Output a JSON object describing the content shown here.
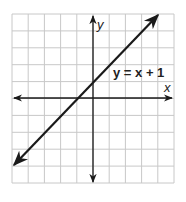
{
  "chart_data": {
    "type": "line",
    "title": "",
    "xlabel": "x",
    "ylabel": "y",
    "xlim": [
      -5,
      5
    ],
    "ylim": [
      -5,
      5
    ],
    "grid": true,
    "grid_step": 1,
    "series": [
      {
        "name": "y = x + 1",
        "equation": "y = x + 1",
        "slope": 1,
        "intercept": 1,
        "x": [
          -5,
          -1,
          0,
          4
        ],
        "y": [
          -4,
          0,
          1,
          5
        ],
        "arrows_both_ends": true
      }
    ],
    "annotations": [
      {
        "text": "y = x + 1",
        "x": 1.5,
        "y": 1.5
      }
    ],
    "colors": {
      "line": "#1a1a1a",
      "grid": "#c8c8c8",
      "axes": "#1a1a1a"
    }
  },
  "labels": {
    "x_axis": "x",
    "y_axis": "y",
    "equation": "y = x + 1"
  }
}
